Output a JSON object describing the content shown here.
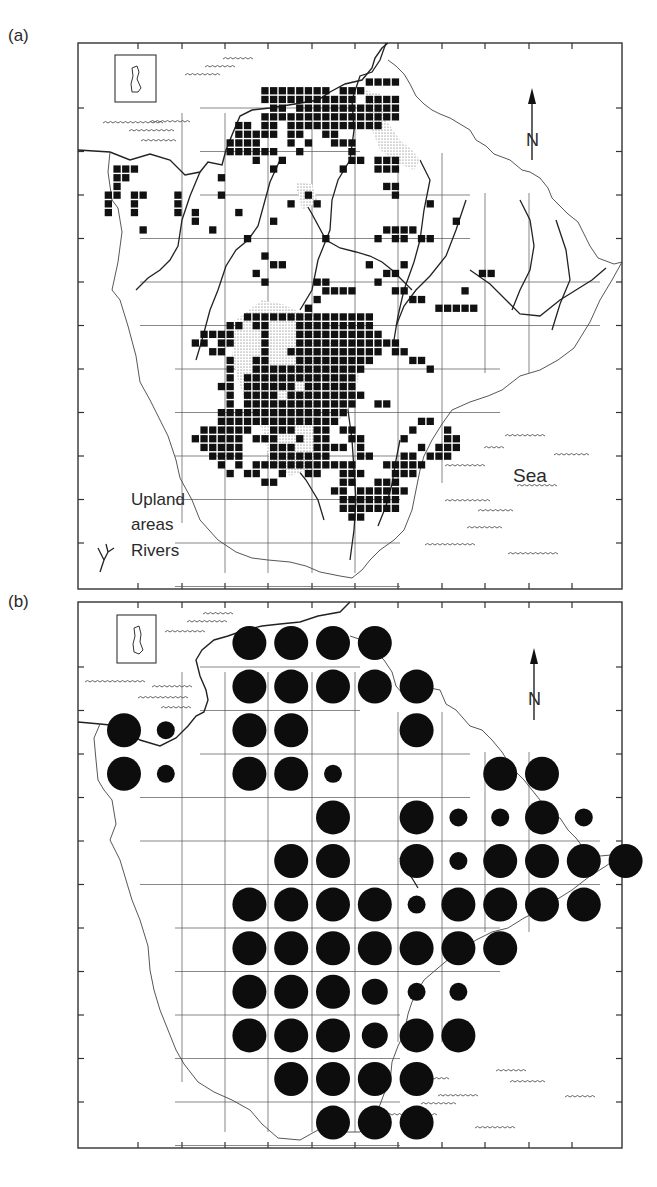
{
  "figure": {
    "panels": [
      {
        "id": "a",
        "label": "(a)",
        "legend": {
          "upland_label_line1": "Upland",
          "upland_label_line2": "areas",
          "rivers_label": "Rivers",
          "rivers_icon": "river-branch-icon"
        },
        "sea_label": "Sea",
        "north_label": "N",
        "north_icon": "north-arrow-icon"
      },
      {
        "id": "b",
        "label": "(b)",
        "north_label": "N",
        "north_icon": "north-arrow-icon"
      }
    ]
  },
  "map_b_circles": {
    "cols_x": [
      124,
      164,
      207,
      249,
      291,
      333,
      375,
      417,
      459,
      500,
      542,
      584
    ],
    "rows_y": [
      643,
      687,
      730,
      773,
      816,
      859,
      903,
      947,
      991,
      1035,
      1080,
      1124
    ],
    "sizes": {
      "L": 17,
      "M": 13,
      "S": 9
    },
    "cells": [
      [
        3,
        0,
        "L"
      ],
      [
        4,
        0,
        "L"
      ],
      [
        5,
        0,
        "L"
      ],
      [
        6,
        0,
        "L"
      ],
      [
        3,
        1,
        "L"
      ],
      [
        4,
        1,
        "L"
      ],
      [
        5,
        1,
        "L"
      ],
      [
        6,
        1,
        "L"
      ],
      [
        7,
        1,
        "L"
      ],
      [
        0,
        2,
        "L"
      ],
      [
        1,
        2,
        "S"
      ],
      [
        3,
        2,
        "L"
      ],
      [
        4,
        2,
        "L"
      ],
      [
        7,
        2,
        "L"
      ],
      [
        0,
        3,
        "L"
      ],
      [
        1,
        3,
        "S"
      ],
      [
        3,
        3,
        "L"
      ],
      [
        4,
        3,
        "L"
      ],
      [
        5,
        3,
        "S"
      ],
      [
        9,
        3,
        "L"
      ],
      [
        10,
        3,
        "L"
      ],
      [
        5,
        4,
        "L"
      ],
      [
        7,
        4,
        "L"
      ],
      [
        8,
        4,
        "S"
      ],
      [
        9,
        4,
        "S"
      ],
      [
        10,
        4,
        "L"
      ],
      [
        11,
        4,
        "S"
      ],
      [
        4,
        5,
        "L"
      ],
      [
        5,
        5,
        "L"
      ],
      [
        7,
        5,
        "L"
      ],
      [
        8,
        5,
        "S"
      ],
      [
        9,
        5,
        "L"
      ],
      [
        10,
        5,
        "L"
      ],
      [
        11,
        5,
        "L"
      ],
      [
        12,
        5,
        "L"
      ],
      [
        3,
        6,
        "L"
      ],
      [
        4,
        6,
        "L"
      ],
      [
        5,
        6,
        "L"
      ],
      [
        6,
        6,
        "L"
      ],
      [
        7,
        6,
        "S"
      ],
      [
        8,
        6,
        "L"
      ],
      [
        9,
        6,
        "L"
      ],
      [
        10,
        6,
        "L"
      ],
      [
        11,
        6,
        "L"
      ],
      [
        3,
        7,
        "L"
      ],
      [
        4,
        7,
        "L"
      ],
      [
        5,
        7,
        "L"
      ],
      [
        6,
        7,
        "L"
      ],
      [
        7,
        7,
        "L"
      ],
      [
        8,
        7,
        "L"
      ],
      [
        9,
        7,
        "L"
      ],
      [
        3,
        8,
        "L"
      ],
      [
        4,
        8,
        "L"
      ],
      [
        5,
        8,
        "L"
      ],
      [
        6,
        8,
        "M"
      ],
      [
        7,
        8,
        "S"
      ],
      [
        8,
        8,
        "S"
      ],
      [
        3,
        9,
        "L"
      ],
      [
        4,
        9,
        "L"
      ],
      [
        5,
        9,
        "L"
      ],
      [
        6,
        9,
        "M"
      ],
      [
        7,
        9,
        "L"
      ],
      [
        8,
        9,
        "L"
      ],
      [
        4,
        10,
        "L"
      ],
      [
        5,
        10,
        "L"
      ],
      [
        6,
        10,
        "L"
      ],
      [
        7,
        10,
        "L"
      ],
      [
        5,
        11,
        "L"
      ],
      [
        6,
        11,
        "L"
      ],
      [
        7,
        11,
        "L"
      ]
    ]
  }
}
